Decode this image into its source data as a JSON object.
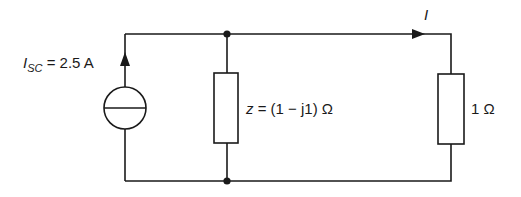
{
  "diagram": {
    "type": "electrical circuit",
    "source": {
      "symbol": "I",
      "subscript": "SC",
      "equals": "=",
      "value": "2.5 A",
      "kind": "current source"
    },
    "shunt_impedance": {
      "symbol": "z",
      "expression": "= (1 − j1) Ω"
    },
    "load": {
      "value": "1 Ω"
    },
    "current": {
      "symbol": "I"
    },
    "colors": {
      "line": "#1a1a1a",
      "background": "#ffffff"
    }
  }
}
